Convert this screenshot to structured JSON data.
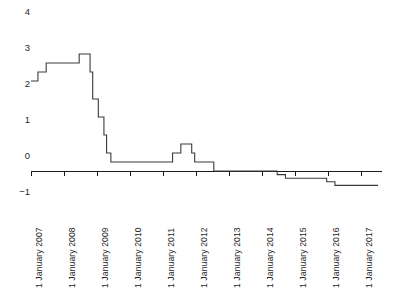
{
  "chart_data": {
    "type": "line",
    "title": "",
    "subtitle": "",
    "xlabel": "",
    "ylabel": "",
    "style": "step-post",
    "grid": false,
    "legend": false,
    "legend_position": "none",
    "ylim": [
      -1,
      4
    ],
    "yticks": [
      4,
      3,
      2,
      1,
      0,
      -1
    ],
    "ytick_labels": [
      "4",
      "3",
      "2",
      "1",
      "0",
      "−1"
    ],
    "xlim": [
      "1 January 2007",
      "1 July 2017"
    ],
    "xticks": [
      "1 January 2007",
      "1 January 2008",
      "1 January 2009",
      "1 January 2010",
      "1 January 2011",
      "1 January 2012",
      "1 January 2013",
      "1 January 2014",
      "1 January 2015",
      "1 January 2016",
      "1 January 2017"
    ],
    "series": [
      {
        "name": "Interest rate",
        "color": "#3a3a3a",
        "x": [
          2007.0,
          2007.21,
          2007.46,
          2008.46,
          2008.79,
          2008.87,
          2009.04,
          2009.21,
          2009.29,
          2009.42,
          2011.29,
          2011.54,
          2011.87,
          2011.96,
          2012.54,
          2014.46,
          2014.71,
          2015.96,
          2016.21,
          2017.5
        ],
        "values": [
          2.5,
          2.75,
          3.0,
          3.25,
          2.75,
          2.0,
          1.5,
          1.0,
          0.5,
          0.25,
          0.5,
          0.75,
          0.5,
          0.25,
          0.0,
          -0.1,
          -0.2,
          -0.3,
          -0.4,
          -0.4
        ]
      }
    ],
    "annotations": []
  },
  "axis": {
    "y_label_4": "4",
    "y_label_3": "3",
    "y_label_2": "2",
    "y_label_1": "1",
    "y_label_0": "0",
    "y_label_neg1": "−1"
  },
  "colors": {
    "line": "#3a3a3a",
    "axis": "#1a1a1a",
    "background": "#ffffff",
    "text": "#262626"
  }
}
